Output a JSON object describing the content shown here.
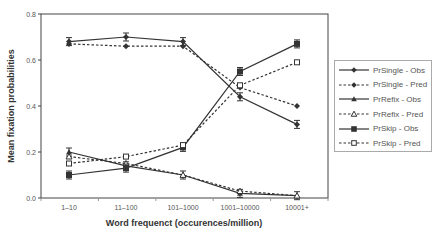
{
  "chart_data": {
    "type": "line",
    "title": "",
    "xlabel": "Word frequenct (occurences/million)",
    "ylabel": "Mean fixation probabilities",
    "ylim": [
      0.0,
      0.8
    ],
    "yticks": [
      "0.0",
      "0.2",
      "0.4",
      "0.6",
      "0.8"
    ],
    "grid": false,
    "legend_position": "right",
    "categories": [
      "1–10",
      "11–100",
      "101–1000",
      "1001–10000",
      "10001+"
    ],
    "series": [
      {
        "name": "PrSingle - Obs",
        "style": "solid",
        "marker": "diamond",
        "values": [
          0.68,
          0.7,
          0.68,
          0.44,
          0.32
        ],
        "error_bars": true
      },
      {
        "name": "PrSingle - Pred",
        "style": "dashed",
        "marker": "diamond",
        "values": [
          0.67,
          0.66,
          0.66,
          0.48,
          0.4
        ],
        "error_bars": false
      },
      {
        "name": "PrRefix - Obs",
        "style": "solid",
        "marker": "triangle",
        "values": [
          0.2,
          0.14,
          0.1,
          0.02,
          0.01
        ],
        "error_bars": true
      },
      {
        "name": "PrRefix - Pred",
        "style": "dashed",
        "marker": "triangle-open",
        "values": [
          0.18,
          0.15,
          0.1,
          0.03,
          0.01
        ],
        "error_bars": false
      },
      {
        "name": "PrSkip - Obs",
        "style": "solid",
        "marker": "square",
        "values": [
          0.1,
          0.13,
          0.22,
          0.55,
          0.67
        ],
        "error_bars": true
      },
      {
        "name": "PrSkip - Pred",
        "style": "dashed",
        "marker": "square-open",
        "values": [
          0.15,
          0.18,
          0.23,
          0.49,
          0.59
        ],
        "error_bars": false
      }
    ]
  },
  "colors": {
    "line": "#333333",
    "axis": "#444444",
    "text": "#555555"
  }
}
